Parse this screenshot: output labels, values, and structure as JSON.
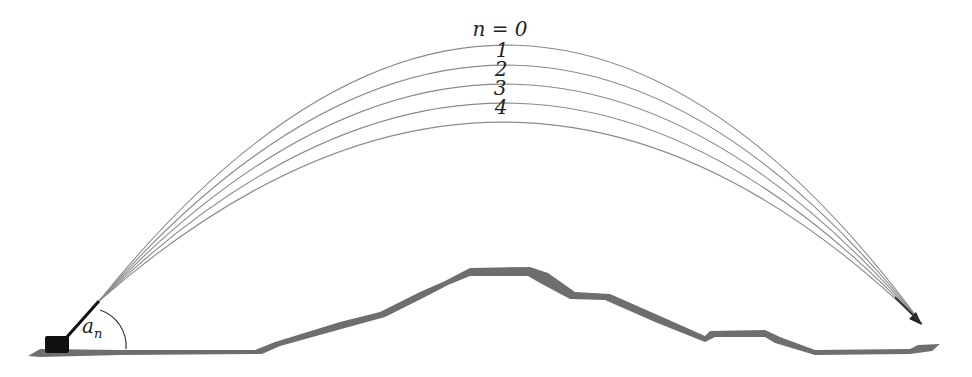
{
  "diagram": {
    "trajectory_labels": [
      "n = 0",
      "1",
      "2",
      "3",
      "4"
    ],
    "angle_label": "a",
    "angle_subscript": "n",
    "colors": {
      "trajectory": "#8a8a8a",
      "terrain": "#6e6e6e",
      "launcher": "#111111",
      "arrow": "#222222"
    },
    "trajectories": [
      {
        "n": 0,
        "apex_y": 39
      },
      {
        "n": 1,
        "apex_y": 59
      },
      {
        "n": 2,
        "apex_y": 78
      },
      {
        "n": 3,
        "apex_y": 97
      },
      {
        "n": 4,
        "apex_y": 116
      }
    ]
  }
}
